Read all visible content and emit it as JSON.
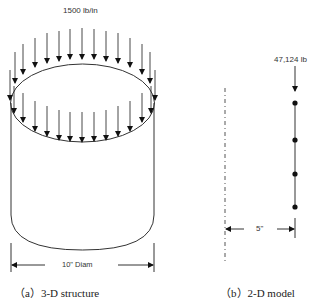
{
  "figure": {
    "panel_a": {
      "load_label": "1500 lb/in",
      "dimension_label": "10\" Diam",
      "caption": "（a）3-D structure"
    },
    "panel_b": {
      "load_label": "47,124 lb",
      "dimension_label": "5\"",
      "caption": "（b）2-D model"
    },
    "colors": {
      "line": "#333333",
      "arrow": "#111111",
      "background": "#ffffff"
    }
  }
}
